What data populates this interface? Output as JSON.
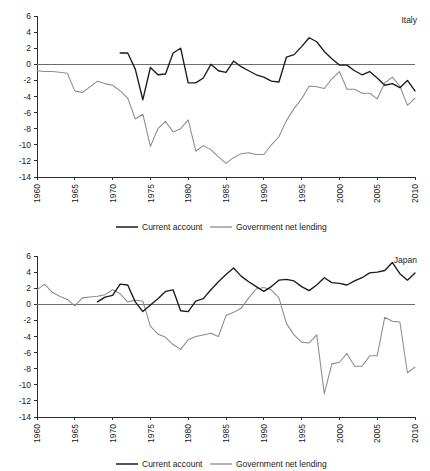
{
  "figure": {
    "series_colors": {
      "current_account": "#1a1a1a",
      "government_net_lending": "#8c8c8c",
      "zero_line": "#6e6e6e",
      "axis": "#2b2b2b"
    },
    "legend_labels": {
      "current_account": "Current account",
      "government_net_lending": "Government net lending"
    },
    "y_ticks": [
      "6",
      "4",
      "2",
      "0",
      "-2",
      "-4",
      "-6",
      "-8",
      "-10",
      "-12",
      "-14"
    ],
    "x_ticks": [
      "1960",
      "1965",
      "1970",
      "1975",
      "1980",
      "1985",
      "1990",
      "1995",
      "2000",
      "2005",
      "2010"
    ]
  },
  "chart_data": [
    {
      "type": "line",
      "title": "Italy",
      "xlabel": "",
      "ylabel": "",
      "xlim": [
        1960,
        2010
      ],
      "ylim": [
        -14,
        6
      ],
      "grid": false,
      "legend_position": "bottom",
      "x": [
        1960,
        1961,
        1962,
        1963,
        1964,
        1965,
        1966,
        1967,
        1968,
        1969,
        1970,
        1971,
        1972,
        1973,
        1974,
        1975,
        1976,
        1977,
        1978,
        1979,
        1980,
        1981,
        1982,
        1983,
        1984,
        1985,
        1986,
        1987,
        1988,
        1989,
        1990,
        1991,
        1992,
        1993,
        1994,
        1995,
        1996,
        1997,
        1998,
        1999,
        2000,
        2001,
        2002,
        2003,
        2004,
        2005,
        2006,
        2007,
        2008,
        2009,
        2010
      ],
      "series": [
        {
          "name": "Current account",
          "color": "#1a1a1a",
          "values": [
            null,
            null,
            null,
            null,
            null,
            null,
            null,
            null,
            null,
            null,
            null,
            1.4,
            1.4,
            -0.6,
            -4.4,
            -0.4,
            -1.3,
            -1.2,
            1.4,
            2.0,
            -2.3,
            -2.3,
            -1.7,
            0.0,
            -0.8,
            -1.0,
            0.4,
            -0.3,
            -0.8,
            -1.3,
            -1.6,
            -2.1,
            -2.2,
            0.9,
            1.2,
            2.2,
            3.3,
            2.8,
            1.6,
            0.7,
            -0.1,
            -0.1,
            -0.8,
            -1.3,
            -0.9,
            -1.7,
            -2.6,
            -2.4,
            -2.9,
            -2.0,
            -3.3
          ]
        },
        {
          "name": "Government net lending",
          "color": "#8c8c8c",
          "values": [
            -0.8,
            -0.9,
            -0.9,
            -1.0,
            -1.1,
            -3.3,
            -3.5,
            -2.8,
            -2.1,
            -2.4,
            -2.6,
            -3.3,
            -4.2,
            -6.8,
            -6.2,
            -10.2,
            -8.0,
            -7.1,
            -8.4,
            -8.0,
            -6.9,
            -10.8,
            -10.1,
            -10.6,
            -11.5,
            -12.3,
            -11.6,
            -11.1,
            -11.0,
            -11.2,
            -11.2,
            -10.0,
            -9.0,
            -7.0,
            -5.5,
            -4.3,
            -2.7,
            -2.8,
            -3.0,
            -1.8,
            -0.9,
            -3.1,
            -3.1,
            -3.6,
            -3.6,
            -4.3,
            -2.3,
            -1.6,
            -2.7,
            -5.1,
            -4.2
          ]
        }
      ]
    },
    {
      "type": "line",
      "title": "Japan",
      "xlabel": "",
      "ylabel": "",
      "xlim": [
        1960,
        2010
      ],
      "ylim": [
        -14,
        6
      ],
      "grid": false,
      "legend_position": "bottom",
      "x": [
        1960,
        1961,
        1962,
        1963,
        1964,
        1965,
        1966,
        1967,
        1968,
        1969,
        1970,
        1971,
        1972,
        1973,
        1974,
        1975,
        1976,
        1977,
        1978,
        1979,
        1980,
        1981,
        1982,
        1983,
        1984,
        1985,
        1986,
        1987,
        1988,
        1989,
        1990,
        1991,
        1992,
        1993,
        1994,
        1995,
        1996,
        1997,
        1998,
        1999,
        2000,
        2001,
        2002,
        2003,
        2004,
        2005,
        2006,
        2007,
        2008,
        2009,
        2010
      ],
      "series": [
        {
          "name": "Current account",
          "color": "#1a1a1a",
          "values": [
            null,
            null,
            null,
            null,
            null,
            null,
            null,
            null,
            0.3,
            0.9,
            1.1,
            2.5,
            2.4,
            0.3,
            -0.9,
            -0.1,
            0.7,
            1.6,
            1.8,
            -0.8,
            -0.9,
            0.4,
            0.7,
            1.8,
            2.8,
            3.7,
            4.5,
            3.5,
            2.8,
            2.2,
            1.6,
            2.2,
            3.0,
            3.1,
            2.9,
            2.2,
            1.7,
            2.4,
            3.3,
            2.7,
            2.6,
            2.4,
            2.9,
            3.3,
            3.9,
            4.0,
            4.2,
            5.2,
            3.8,
            3.0,
            3.9
          ]
        },
        {
          "name": "Government net lending",
          "color": "#8c8c8c",
          "values": [
            1.8,
            2.5,
            1.5,
            1.0,
            0.6,
            -0.2,
            0.8,
            0.9,
            1.0,
            1.2,
            1.8,
            1.3,
            0.3,
            0.5,
            0.4,
            -2.7,
            -3.7,
            -4.1,
            -5.0,
            -5.6,
            -4.4,
            -4.0,
            -3.8,
            -3.6,
            -4.0,
            -1.4,
            -1.0,
            -0.5,
            0.8,
            1.9,
            2.1,
            1.8,
            0.8,
            -2.4,
            -3.8,
            -4.7,
            -4.8,
            -3.8,
            -11.1,
            -7.4,
            -7.2,
            -6.1,
            -7.7,
            -7.7,
            -6.4,
            -6.4,
            -1.6,
            -2.1,
            -2.2,
            -8.5,
            -7.8
          ]
        }
      ]
    }
  ]
}
